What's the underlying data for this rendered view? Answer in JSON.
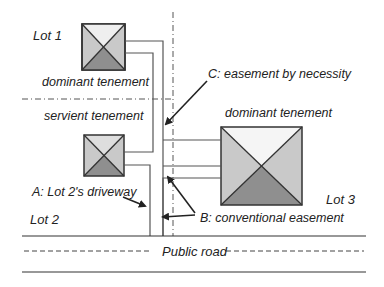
{
  "labels": {
    "lot1": "Lot 1",
    "lot2": "Lot 2",
    "lot3": "Lot 3",
    "dominant_upper": "dominant tenement",
    "servient": "servient tenement",
    "dominant_right": "dominant tenement",
    "easement_c": "C: easement by necessity",
    "driveway_a": "A: Lot 2's driveway",
    "easement_b": "B: conventional easement",
    "public_road": "Public road"
  },
  "colors": {
    "line": "#444444",
    "house_light": "#c9c9c9",
    "house_top": "#efefef",
    "house_dark": "#8f8f8f"
  }
}
